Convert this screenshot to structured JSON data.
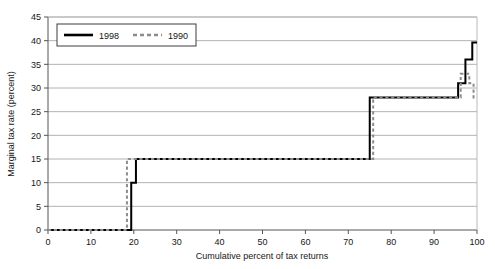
{
  "chart_data": {
    "type": "line",
    "title": "",
    "xlabel": "Cumulative percent of tax returns",
    "ylabel": "Marginal tax rate (percent)",
    "xlim": [
      0,
      100
    ],
    "ylim": [
      0,
      45
    ],
    "xticks": [
      0,
      10,
      20,
      30,
      40,
      50,
      60,
      70,
      80,
      90,
      100
    ],
    "yticks": [
      0,
      5,
      10,
      15,
      20,
      25,
      30,
      35,
      40,
      45
    ],
    "grid": "horizontal",
    "legend_position": "top-left-inside",
    "step_style": "post",
    "series": [
      {
        "name": "1998",
        "style": "solid",
        "color": "#000000",
        "width": 2.0,
        "points": [
          [
            0,
            0
          ],
          [
            19.4,
            0
          ],
          [
            19.4,
            10
          ],
          [
            20.5,
            10
          ],
          [
            20.5,
            15
          ],
          [
            75.0,
            15
          ],
          [
            75.0,
            28
          ],
          [
            95.6,
            28
          ],
          [
            95.6,
            31
          ],
          [
            97.3,
            31
          ],
          [
            97.3,
            36
          ],
          [
            98.9,
            36
          ],
          [
            98.9,
            39.6
          ],
          [
            100,
            39.6
          ]
        ]
      },
      {
        "name": "1990",
        "style": "dashed",
        "color": "#8c8c8c",
        "width": 2.0,
        "points": [
          [
            0,
            0
          ],
          [
            18.4,
            0
          ],
          [
            18.4,
            15
          ],
          [
            75.8,
            15
          ],
          [
            75.8,
            28
          ],
          [
            96.2,
            28
          ],
          [
            96.2,
            33
          ],
          [
            98.2,
            33
          ],
          [
            98.2,
            31
          ],
          [
            99.2,
            31
          ],
          [
            99.2,
            28
          ],
          [
            100,
            28
          ]
        ]
      }
    ]
  },
  "legend": {
    "entries": [
      {
        "label": "1998"
      },
      {
        "label": "1990"
      }
    ]
  },
  "axes": {
    "y_title": "Marginal tax rate (percent)",
    "x_title": "Cumulative percent of tax returns",
    "y_tick_labels": [
      "0",
      "5",
      "10",
      "15",
      "20",
      "25",
      "30",
      "35",
      "40",
      "45"
    ],
    "x_tick_labels": [
      "0",
      "10",
      "20",
      "30",
      "40",
      "50",
      "60",
      "70",
      "80",
      "90",
      "100"
    ]
  },
  "colors": {
    "series_1998": "#000000",
    "series_1990": "#8c8c8c",
    "gridline": "#a9a9a9",
    "axis": "#555555",
    "background": "#ffffff"
  }
}
